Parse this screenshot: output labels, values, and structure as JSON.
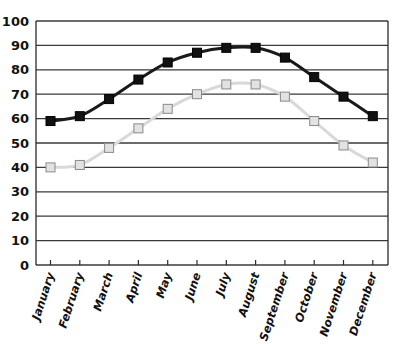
{
  "chart_data": {
    "type": "line",
    "title": "",
    "xlabel": "",
    "ylabel": "",
    "ylim": [
      0,
      100
    ],
    "yticks": [
      0,
      10,
      20,
      30,
      40,
      50,
      60,
      70,
      80,
      90,
      100
    ],
    "grid": true,
    "legend": "none",
    "categories": [
      "January",
      "February",
      "March",
      "April",
      "May",
      "June",
      "July",
      "August",
      "September",
      "October",
      "November",
      "December"
    ],
    "series": [
      {
        "name": "High",
        "color": "#1a1a1a",
        "marker": "square-filled",
        "values": [
          59,
          61,
          68,
          76,
          83,
          87,
          89,
          89,
          85,
          77,
          69,
          61
        ]
      },
      {
        "name": "Low",
        "color": "#d9d9d9",
        "marker": "square-light",
        "values": [
          40,
          41,
          48,
          56,
          64,
          70,
          74,
          74,
          69,
          59,
          49,
          42
        ]
      }
    ]
  },
  "colors": {
    "grid": "#3a3a3a",
    "axis": "#2a2a2a",
    "dark_line": "#1a1a1a",
    "dark_marker": "#111111",
    "light_line": "#d9d9d9",
    "light_marker_fill": "#e2e2e2",
    "light_marker_stroke": "#8a8a8a"
  }
}
